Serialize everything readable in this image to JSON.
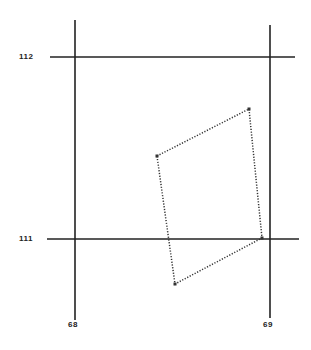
{
  "diagram": {
    "type": "coordinate-grid-polygon",
    "y_labels": [
      {
        "text": "112",
        "y": 57
      },
      {
        "text": "111",
        "y": 239
      }
    ],
    "x_labels": [
      {
        "text": "68",
        "x": 75
      },
      {
        "text": "69",
        "x": 270
      }
    ],
    "grid_lines": {
      "vertical": [
        {
          "x": 75,
          "y1": 20,
          "y2": 320
        },
        {
          "x": 270,
          "y1": 25,
          "y2": 318
        }
      ],
      "horizontal": [
        {
          "y": 57,
          "x1": 50,
          "x2": 295
        },
        {
          "y": 239,
          "x1": 47,
          "x2": 299
        }
      ]
    },
    "polygon": {
      "style": "dotted",
      "vertices": [
        [
          157,
          156
        ],
        [
          249,
          109
        ],
        [
          262,
          238
        ],
        [
          175,
          284
        ]
      ]
    },
    "colors": {
      "line": "#222222",
      "polygon": "#333333",
      "background": "#ffffff"
    }
  }
}
